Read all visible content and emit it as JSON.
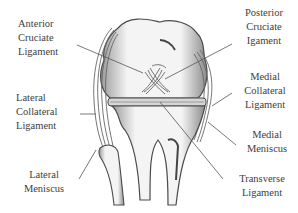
{
  "diagram": {
    "labels": [
      {
        "id": "anterior-cruciate-ligament",
        "lines": [
          "Anterior",
          "Cruciate",
          "Ligament"
        ]
      },
      {
        "id": "posterior-cruciate-ligament",
        "lines": [
          "Posterior",
          "Cruciate",
          "Igament"
        ]
      },
      {
        "id": "lateral-collateral-ligament",
        "lines": [
          "Lateral",
          "Collateral",
          "Ligament"
        ]
      },
      {
        "id": "medial-collateral-ligament",
        "lines": [
          "Medial",
          "Collateral",
          "Ligament"
        ]
      },
      {
        "id": "medial-meniscus",
        "lines": [
          "Medial",
          "Meniscus"
        ]
      },
      {
        "id": "lateral-meniscus",
        "lines": [
          "Lateral",
          "Meniscus"
        ]
      },
      {
        "id": "transverse-ligament",
        "lines": [
          "Transverse",
          "Ligament"
        ]
      }
    ],
    "colors": {
      "line": "#555555",
      "shade": "#8a8a8a",
      "dark": "#3c3c3c",
      "background": "#ffffff"
    }
  }
}
